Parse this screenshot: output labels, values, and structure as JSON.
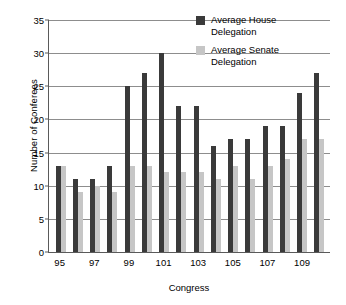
{
  "chart_data": {
    "type": "bar",
    "title": "",
    "xlabel": "Congress",
    "ylabel": "Number of Conferees",
    "ylim": [
      0,
      35
    ],
    "ytick_step": 5,
    "yticks": [
      0,
      5,
      10,
      15,
      20,
      25,
      30,
      35
    ],
    "grid": true,
    "legend_position": "top-right",
    "categories": [
      95,
      96,
      97,
      98,
      99,
      100,
      101,
      102,
      103,
      104,
      105,
      106,
      107,
      108,
      109,
      110
    ],
    "tick_labels": [
      "95",
      "",
      "97",
      "",
      "99",
      "",
      "101",
      "",
      "103",
      "",
      "105",
      "",
      "107",
      "",
      "109",
      ""
    ],
    "series": [
      {
        "name": "Average House Delegation",
        "color": "#3a3a3a",
        "values": [
          13,
          11,
          11,
          13,
          25,
          27,
          30,
          22,
          22,
          16,
          17,
          17,
          19,
          19,
          24,
          27
        ]
      },
      {
        "name": "Average Senate Delegation",
        "color": "#c6c6c6",
        "values": [
          13,
          9,
          10,
          9,
          13,
          13,
          12,
          12,
          12,
          11,
          13,
          11,
          13,
          14,
          17,
          17
        ]
      }
    ]
  },
  "legend": {
    "items": [
      {
        "label": "Average House Delegation",
        "swatch": "house"
      },
      {
        "label": "Average Senate Delegation",
        "swatch": "senate"
      }
    ]
  }
}
